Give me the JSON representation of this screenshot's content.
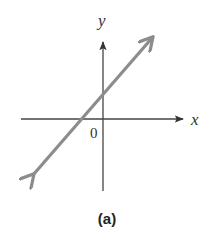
{
  "figure": {
    "caption": "(a)",
    "axes": {
      "x_label": "x",
      "y_label": "y",
      "origin_label": "0"
    },
    "line": {
      "description": "line with positive slope, positive y-intercept, negative x-intercept, arrows at both ends",
      "color": "#8c8c8c"
    },
    "colors": {
      "axis": "#444444",
      "line": "#8c8c8c",
      "background": "#ffffff"
    }
  }
}
